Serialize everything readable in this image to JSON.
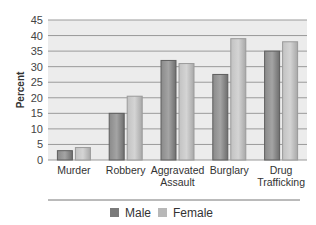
{
  "chart_data": {
    "type": "bar",
    "title": "",
    "xlabel": "",
    "ylabel": "Percent",
    "ylim": [
      0,
      45
    ],
    "yticks": [
      0,
      5,
      10,
      15,
      20,
      25,
      30,
      35,
      40,
      45
    ],
    "grid": true,
    "legend_position": "bottom",
    "categories": [
      "Murder",
      "Robbery",
      "Aggravated Assault",
      "Burglary",
      "Drug Trafficking"
    ],
    "category_lines": [
      [
        "Murder"
      ],
      [
        "Robbery"
      ],
      [
        "Aggravated",
        "Assault"
      ],
      [
        "Burglary"
      ],
      [
        "Drug",
        "Trafficking"
      ]
    ],
    "series": [
      {
        "name": "Male",
        "color": "#7a7a7a",
        "values": [
          3,
          15,
          32,
          27.5,
          35
        ]
      },
      {
        "name": "Female",
        "color": "#b8b8b8",
        "values": [
          4,
          20.5,
          31,
          39,
          38
        ]
      }
    ]
  },
  "colors": {
    "plot_bg": "#ececec",
    "gridline": "#9a9a9a",
    "separator": "#777777"
  }
}
